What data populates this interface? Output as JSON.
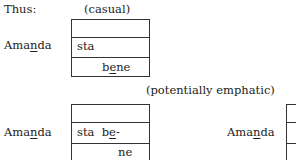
{
  "header": {
    "label": "Thus:"
  },
  "casual": {
    "caption": "(casual)",
    "speaker": {
      "pre": "Ama",
      "underlined": "n",
      "post": "da"
    },
    "rows": [
      {
        "text": ""
      },
      {
        "text": "sta"
      },
      {
        "text_pre": "b",
        "text_underlined": "e",
        "text_post": "ne"
      }
    ]
  },
  "emphatic": {
    "caption": "(potentially emphatic)",
    "left": {
      "speaker": {
        "pre": "Ama",
        "underlined": "n",
        "post": "da"
      },
      "rows": [
        {
          "text": ""
        },
        {
          "text_pre": "sta  b",
          "text_underlined": "e",
          "text_post": "-"
        },
        {
          "text": "ne"
        }
      ]
    },
    "right": {
      "speaker": {
        "pre": "Ama",
        "underlined": "n",
        "post": "da"
      }
    }
  }
}
